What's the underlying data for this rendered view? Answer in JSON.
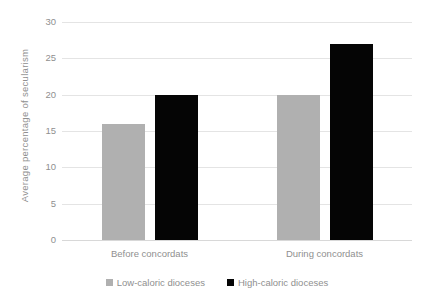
{
  "chart_data": {
    "type": "bar",
    "title": "",
    "subtitle": "",
    "xlabel": "",
    "ylabel": "Average percentage of secularism",
    "categories": [
      "Before concordats",
      "During concordats"
    ],
    "series": [
      {
        "name": "Low-caloric dioceses",
        "values": [
          16,
          20
        ],
        "color": "#b0b0b0"
      },
      {
        "name": "High-caloric dioceses",
        "values": [
          20,
          27
        ],
        "color": "#050505"
      }
    ],
    "ylim": [
      0,
      30
    ],
    "yticks": [
      0,
      5,
      10,
      15,
      20,
      25,
      30
    ],
    "ytick_labels": [
      "0",
      "5",
      "10",
      "15",
      "20",
      "25",
      "30"
    ],
    "grid": true,
    "grid_axis": "y",
    "legend_position": "bottom-center",
    "background_color": "#ffffff",
    "grid_color": "#e4e4e4",
    "text_color": "#8f8f8f"
  }
}
